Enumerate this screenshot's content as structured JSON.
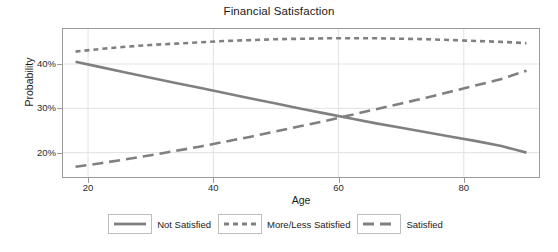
{
  "chart_data": {
    "type": "line",
    "title": "Financial Satisfaction",
    "xlabel": "Age",
    "ylabel": "Probability",
    "xlim": [
      16,
      92
    ],
    "ylim": [
      0.145,
      0.479
    ],
    "xticks": [
      20,
      40,
      60,
      80
    ],
    "xtick_labels": [
      "20",
      "40",
      "60",
      "80"
    ],
    "yticks": [
      0.2,
      0.3,
      0.4
    ],
    "ytick_labels": [
      "20%",
      "30%",
      "40%"
    ],
    "grid": true,
    "legend_position": "bottom-center",
    "line_color": "#808080",
    "x": [
      18,
      22,
      26,
      30,
      34,
      38,
      42,
      46,
      50,
      54,
      58,
      62,
      66,
      70,
      74,
      78,
      82,
      86,
      90
    ],
    "series": [
      {
        "name": "Not Satisfied",
        "style": "solid",
        "values": [
          0.405,
          0.393,
          0.381,
          0.369,
          0.357,
          0.346,
          0.334,
          0.322,
          0.311,
          0.299,
          0.288,
          0.277,
          0.266,
          0.256,
          0.246,
          0.236,
          0.226,
          0.215,
          0.2
        ]
      },
      {
        "name": "More/Less Satisfied",
        "style": "dotted",
        "values": [
          0.428,
          0.434,
          0.439,
          0.443,
          0.446,
          0.449,
          0.452,
          0.454,
          0.456,
          0.457,
          0.458,
          0.458,
          0.458,
          0.457,
          0.456,
          0.454,
          0.452,
          0.45,
          0.447
        ]
      },
      {
        "name": "Satisfied",
        "style": "dashed",
        "values": [
          0.168,
          0.176,
          0.185,
          0.194,
          0.204,
          0.214,
          0.225,
          0.236,
          0.248,
          0.26,
          0.272,
          0.285,
          0.298,
          0.311,
          0.324,
          0.338,
          0.352,
          0.366,
          0.385
        ]
      }
    ],
    "annotations": []
  },
  "legend": {
    "entries": [
      {
        "label": "Not Satisfied"
      },
      {
        "label": "More/Less Satisfied"
      },
      {
        "label": "Satisfied"
      }
    ]
  }
}
